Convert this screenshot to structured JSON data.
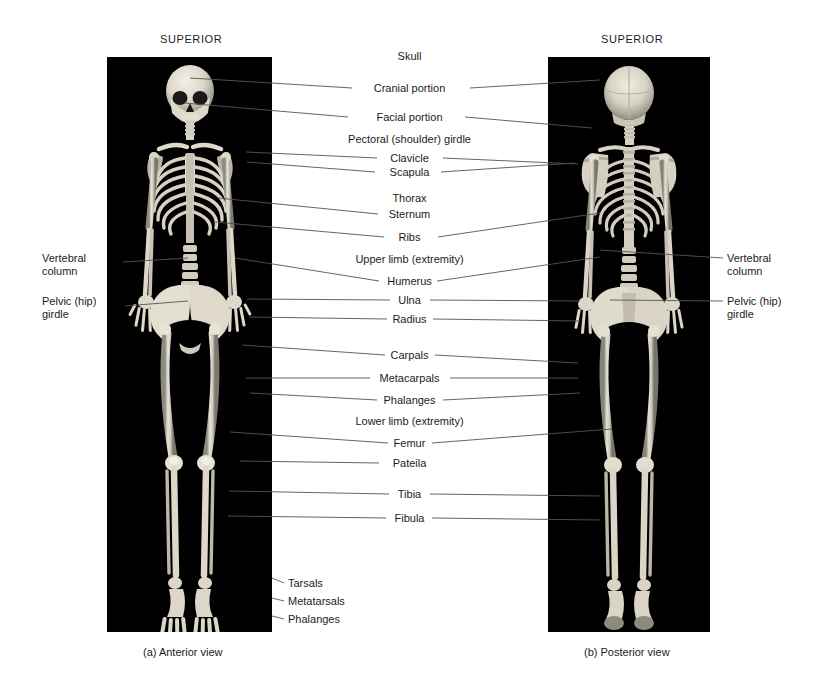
{
  "figure": {
    "background_color": "#ffffff",
    "panel_color": "#000000",
    "leader_line_color": "#555555"
  },
  "headings": {
    "superior_left": "SUPERIOR",
    "superior_right": "SUPERIOR"
  },
  "captions": {
    "left": "(a) Anterior view",
    "right": "(b) Posterior view"
  },
  "center_labels": [
    {
      "text": "Skull",
      "y": 56,
      "leader_left": false,
      "leader_right": false
    },
    {
      "text": "Cranial portion",
      "y": 88,
      "leader_left": true,
      "leader_right": true
    },
    {
      "text": "Facial portion",
      "y": 117,
      "leader_left": true,
      "leader_right": true
    },
    {
      "text": "Pectoral (shoulder) girdle",
      "y": 139,
      "leader_left": false,
      "leader_right": false
    },
    {
      "text": "Clavicle",
      "y": 158,
      "leader_left": true,
      "leader_right": true
    },
    {
      "text": "Scapula",
      "y": 172,
      "leader_left": true,
      "leader_right": true
    },
    {
      "text": "Thorax",
      "y": 198,
      "leader_left": false,
      "leader_right": false
    },
    {
      "text": "Sternum",
      "y": 214,
      "leader_left": true,
      "leader_right": false
    },
    {
      "text": "Ribs",
      "y": 237,
      "leader_left": true,
      "leader_right": true
    },
    {
      "text": "Upper limb (extremity)",
      "y": 259,
      "leader_left": false,
      "leader_right": false
    },
    {
      "text": "Humerus",
      "y": 281,
      "leader_left": true,
      "leader_right": true
    },
    {
      "text": "Ulna",
      "y": 300,
      "leader_left": true,
      "leader_right": true
    },
    {
      "text": "Radius",
      "y": 319,
      "leader_left": true,
      "leader_right": true
    },
    {
      "text": "Carpals",
      "y": 355,
      "leader_left": true,
      "leader_right": true
    },
    {
      "text": "Metacarpals",
      "y": 378,
      "leader_left": true,
      "leader_right": true
    },
    {
      "text": "Phalanges",
      "y": 400,
      "leader_left": true,
      "leader_right": true
    },
    {
      "text": "Lower limb (extremity)",
      "y": 421,
      "leader_left": false,
      "leader_right": false
    },
    {
      "text": "Femur",
      "y": 443,
      "leader_left": true,
      "leader_right": true
    },
    {
      "text": "Pateila",
      "y": 463,
      "leader_left": true,
      "leader_right": false
    },
    {
      "text": "Tibia",
      "y": 494,
      "leader_left": true,
      "leader_right": true
    },
    {
      "text": "Fibula",
      "y": 518,
      "leader_left": true,
      "leader_right": true
    }
  ],
  "side_labels": {
    "left": [
      {
        "line1": "Vertebral",
        "line2": "column",
        "y": 258
      },
      {
        "line1": "Pelvic (hip)",
        "line2": "girdle",
        "y": 298
      }
    ],
    "right": [
      {
        "line1": "Vertebral",
        "line2": "column",
        "y": 258
      },
      {
        "line1": "Pelvic (hip)",
        "line2": "girdle",
        "y": 298
      }
    ]
  },
  "foot_labels": [
    {
      "text": "Tarsals",
      "y": 583
    },
    {
      "text": "Metatarsals",
      "y": 601
    },
    {
      "text": "Phalanges",
      "y": 619
    }
  ],
  "panels": {
    "left": {
      "name": "anterior-skeleton-photo",
      "x": 107,
      "y": 57,
      "width": 165,
      "height": 575
    },
    "right": {
      "name": "posterior-skeleton-photo",
      "x": 548,
      "y": 57,
      "width": 162,
      "height": 575
    }
  }
}
